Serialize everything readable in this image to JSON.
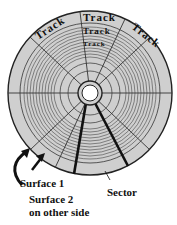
{
  "diagram": {
    "type": "disk-geometry",
    "disk_fill": "#cfcfcf",
    "track_line_color": "#333333",
    "hub_fill": "#ffffff",
    "sector_highlight_color": "#111111",
    "track_labels": [
      "Track",
      "Track",
      "Track",
      "Track",
      "Track"
    ],
    "labels": {
      "surface1": "Surface 1",
      "surface2_line1": "Surface 2",
      "surface2_line2": "on other side",
      "sector": "Sector"
    }
  }
}
